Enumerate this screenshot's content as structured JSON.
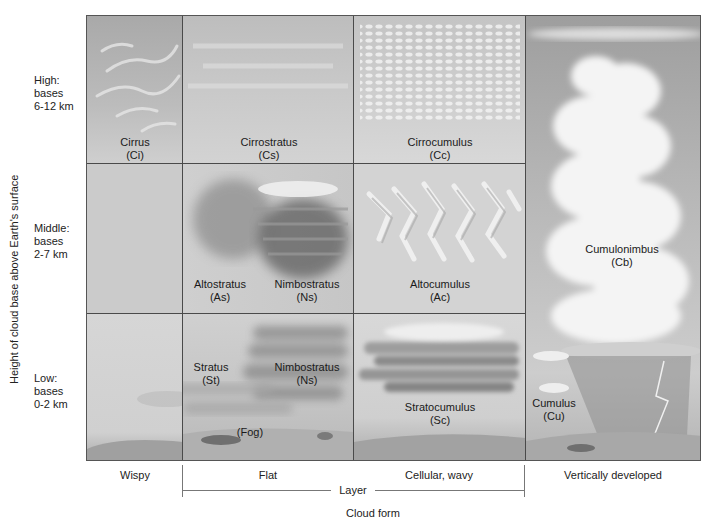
{
  "figure": {
    "y_axis_title": "Height of cloud base above Earth's surface",
    "x_axis_title": "Cloud form",
    "group_label": "Layer",
    "rows": [
      {
        "name": "High",
        "lines": [
          "High:",
          "bases",
          "6-12 km"
        ]
      },
      {
        "name": "Middle",
        "lines": [
          "Middle:",
          "bases",
          "2-7 km"
        ]
      },
      {
        "name": "Low",
        "lines": [
          "Low:",
          "bases",
          "0-2 km"
        ]
      }
    ],
    "columns": [
      {
        "label": "Wispy"
      },
      {
        "label": "Flat"
      },
      {
        "label": "Cellular, wavy"
      },
      {
        "label": "Vertically developed"
      }
    ],
    "clouds": {
      "cirrus": {
        "name": "Cirrus",
        "abbr": "(Ci)"
      },
      "cirrostratus": {
        "name": "Cirrostratus",
        "abbr": "(Cs)"
      },
      "cirrocumulus": {
        "name": "Cirrocumulus",
        "abbr": "(Cc)"
      },
      "altostratus": {
        "name": "Altostratus",
        "abbr": "(As)"
      },
      "nimbostratus_mid": {
        "name": "Nimbostratus",
        "abbr": "(Ns)"
      },
      "altocumulus": {
        "name": "Altocumulus",
        "abbr": "(Ac)"
      },
      "stratus": {
        "name": "Stratus",
        "abbr": "(St)"
      },
      "nimbostratus_low": {
        "name": "Nimbostratus",
        "abbr": "(Ns)"
      },
      "fog": {
        "name": "(Fog)"
      },
      "stratocumulus": {
        "name": "Stratocumulus",
        "abbr": "(Sc)"
      },
      "cumulonimbus": {
        "name": "Cumulonimbus",
        "abbr": "(Cb)"
      },
      "cumulus": {
        "name": "Cumulus",
        "abbr": "(Cu)"
      }
    }
  }
}
